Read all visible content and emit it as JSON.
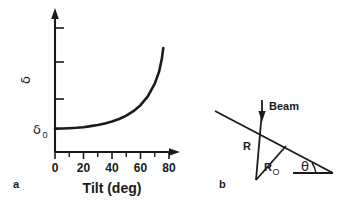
{
  "figure": {
    "background_color": "#ffffff",
    "ink_color": "#1a1a1a",
    "panels": [
      {
        "key": "a",
        "label": "a"
      },
      {
        "key": "b",
        "label": "b"
      }
    ]
  },
  "chart_data": {
    "type": "line",
    "title": "",
    "xlabel": "Tilt (deg)",
    "ylabel": "δ",
    "xlim": [
      0,
      85
    ],
    "ylim": [
      0,
      1
    ],
    "grid": false,
    "legend": null,
    "x_tick_labels": [
      "0",
      "20",
      "40",
      "60",
      "80"
    ],
    "x_tick_values": [
      0,
      20,
      40,
      60,
      80
    ],
    "x_minor_tick_values": [
      10,
      30,
      50,
      70
    ],
    "y_tick_labels": [
      "",
      "",
      ""
    ],
    "y_axis_arrow": true,
    "x_axis_arrow": true,
    "baseline_label": "δ",
    "baseline_label_subscript": "0",
    "baseline_value": 0.18,
    "series": [
      {
        "name": "δ vs tilt",
        "x": [
          0,
          5,
          10,
          15,
          20,
          25,
          30,
          35,
          40,
          45,
          50,
          55,
          60,
          65,
          70,
          73,
          75,
          76
        ],
        "y": [
          0.18,
          0.181,
          0.183,
          0.186,
          0.191,
          0.199,
          0.208,
          0.22,
          0.235,
          0.254,
          0.28,
          0.314,
          0.36,
          0.426,
          0.526,
          0.616,
          0.72,
          0.8
        ]
      }
    ]
  },
  "diagram": {
    "name": "tilted-specimen-geometry",
    "labels": {
      "beam": "Beam",
      "radius": "R",
      "radius_zero": "R",
      "radius_zero_subscript": "O",
      "angle": "θ"
    },
    "elements": [
      "beam-arrow",
      "specimen-tilt-line",
      "vertical-radius-line",
      "projected-radius-line",
      "horizontal-baseline",
      "angle-arc"
    ]
  }
}
